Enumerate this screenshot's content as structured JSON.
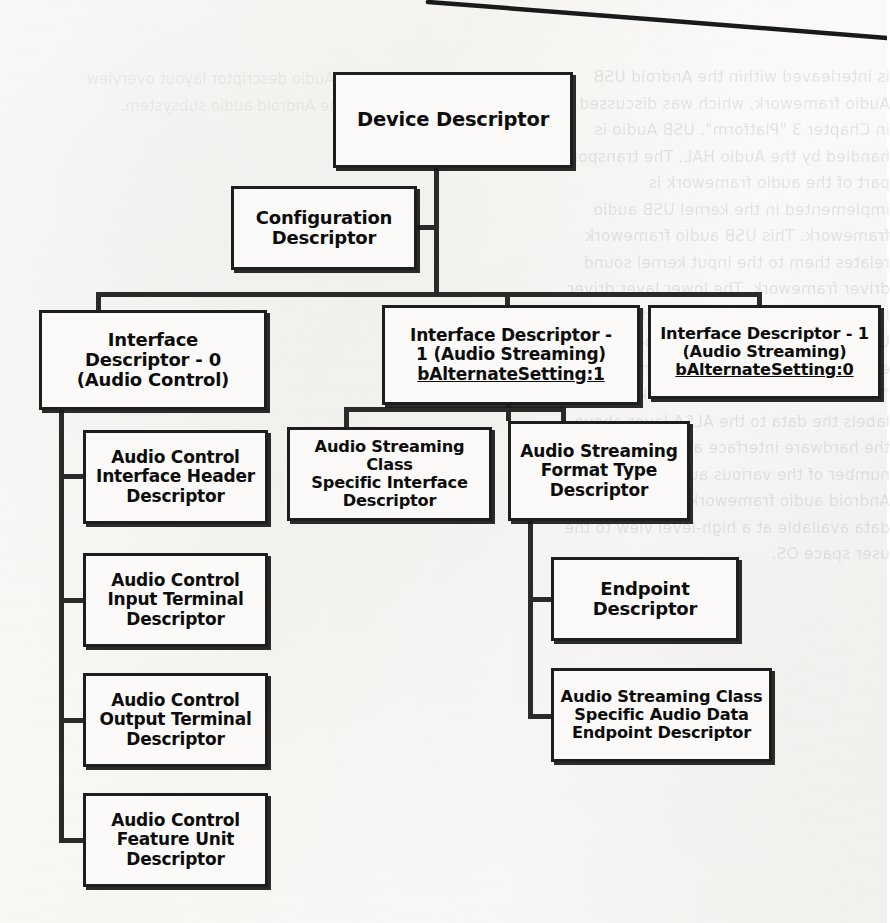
{
  "document": {
    "type": "diagram",
    "title": "USB Audio Descriptor Hierarchy",
    "background_note": "scanned book page with faint mirrored show-through text and a diagonal page-edge line at top right"
  },
  "bleed_text": {
    "right_block": "is interleaved within the Android USB Audio framework, which was discussed in Chapter 3 \"Platform\". USB Audio is handled by the Audio HAL. The transport part of the audio framework is implemented in the kernel USB audio framework. This USB audio framework relates them to the input kernel sound driver framework. The lower layer driver layer can be a Shared Architecture after USB enumeration. The figure below has explained the USB Audio within the \"sound\" stack. The USB Audio kernel labels the data to the ALSA layer above the hardware interface and then their number of the various audio buffers. The Android audio framework will make the data available at a high-level view to the user space OS.",
    "left_block": "USB Audio descriptor layout overview for the Android audio subsystem."
  },
  "nodes": {
    "device": {
      "label": "Device Descriptor"
    },
    "configuration": {
      "label": "Configuration\nDescriptor"
    },
    "interface_0": {
      "label": "Interface\nDescriptor - 0\n(Audio Control)"
    },
    "interface_1_alt1": {
      "label": "Interface Descriptor -\n1 (Audio Streaming)",
      "underline": "bAlternateSetting:1"
    },
    "interface_1_alt0": {
      "label": "Interface Descriptor - 1\n(Audio Streaming)",
      "underline": "bAlternateSetting:0"
    },
    "ac_interface_header": {
      "label": "Audio Control\nInterface Header\nDescriptor"
    },
    "ac_input_terminal": {
      "label": "Audio Control\nInput Terminal\nDescriptor"
    },
    "ac_output_terminal": {
      "label": "Audio Control\nOutput Terminal\nDescriptor"
    },
    "ac_feature_unit": {
      "label": "Audio Control\nFeature Unit\nDescriptor"
    },
    "as_class_specific_interface": {
      "label": "Audio Streaming Class\nSpecific Interface\nDescriptor"
    },
    "as_format_type": {
      "label": "Audio Streaming\nFormat Type\nDescriptor"
    },
    "endpoint": {
      "label": "Endpoint\nDescriptor"
    },
    "as_class_specific_endpoint": {
      "label": "Audio Streaming Class\nSpecific Audio Data\nEndpoint Descriptor"
    }
  },
  "edges": [
    {
      "from": "device",
      "to": "configuration"
    },
    {
      "from": "configuration",
      "to": "interface_0"
    },
    {
      "from": "configuration",
      "to": "interface_1_alt1"
    },
    {
      "from": "configuration",
      "to": "interface_1_alt0"
    },
    {
      "from": "interface_0",
      "to": "ac_interface_header"
    },
    {
      "from": "interface_0",
      "to": "ac_input_terminal"
    },
    {
      "from": "interface_0",
      "to": "ac_output_terminal"
    },
    {
      "from": "interface_0",
      "to": "ac_feature_unit"
    },
    {
      "from": "interface_1_alt1",
      "to": "as_class_specific_interface"
    },
    {
      "from": "interface_1_alt1",
      "to": "as_format_type"
    },
    {
      "from": "as_format_type",
      "to": "endpoint"
    },
    {
      "from": "as_format_type",
      "to": "as_class_specific_endpoint"
    }
  ],
  "colors": {
    "paper": "#faf9f6",
    "ink": "#1e1e1e",
    "box_fill": "#fbfaf8",
    "connector": "#2a2a2a"
  }
}
